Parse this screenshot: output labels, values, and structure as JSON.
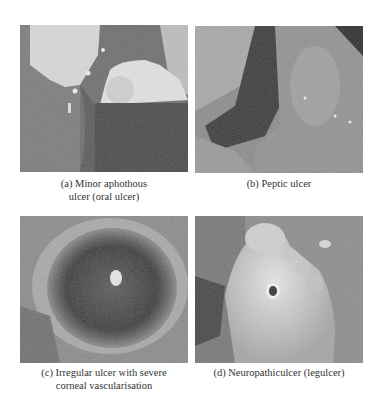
{
  "figure": {
    "panels": [
      {
        "id": "a",
        "caption_lines": [
          "(a) Minor aphothous",
          "ulcer (oral ulcer)"
        ],
        "subject": "oral-ulcer-photo"
      },
      {
        "id": "b",
        "caption_lines": [
          "(b) Peptic ulcer"
        ],
        "subject": "peptic-ulcer-photo"
      },
      {
        "id": "c",
        "caption_lines": [
          "(c) Irregular ulcer with severe",
          "corneal vascularisation"
        ],
        "subject": "corneal-ulcer-photo"
      },
      {
        "id": "d",
        "caption_lines": [
          "(d) Neuropathiculcer (legulcer)"
        ],
        "subject": "foot-ulcer-photo"
      }
    ]
  }
}
